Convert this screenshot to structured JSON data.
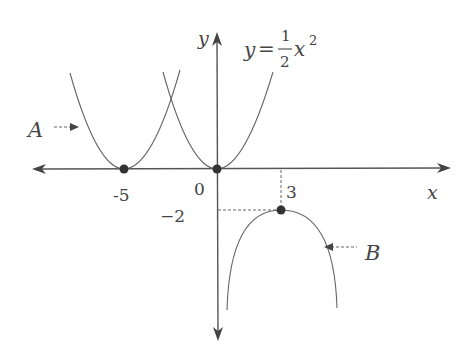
{
  "figure": {
    "type": "function-graph-diagram",
    "axes": {
      "x_label": "x",
      "y_label": "y"
    },
    "equation": {
      "lhs": "y",
      "equals": "=",
      "numerator": "1",
      "denominator": "2",
      "var": "x",
      "exponent": "2"
    },
    "tick_labels": {
      "neg_five": "-5",
      "zero": "0",
      "three": "3",
      "neg_two": "−2"
    },
    "curve_labels": {
      "A": "A",
      "B": "B"
    },
    "curves": [
      {
        "name": "base",
        "label": "y = 1/2 x^2",
        "vertex": [
          0,
          0
        ],
        "opens": "up"
      },
      {
        "name": "A",
        "label": "A",
        "vertex": [
          -5,
          0
        ],
        "opens": "up"
      },
      {
        "name": "B",
        "label": "B",
        "vertex": [
          3,
          -2
        ],
        "opens": "down"
      }
    ],
    "points": [
      {
        "name": "vertex-A",
        "x": -5,
        "y": 0
      },
      {
        "name": "origin",
        "x": 0,
        "y": 0
      },
      {
        "name": "vertex-B",
        "x": 3,
        "y": -2
      }
    ],
    "colors": {
      "axis": "#555555",
      "curve": "#666666",
      "point": "#333333",
      "text": "#444444"
    }
  }
}
